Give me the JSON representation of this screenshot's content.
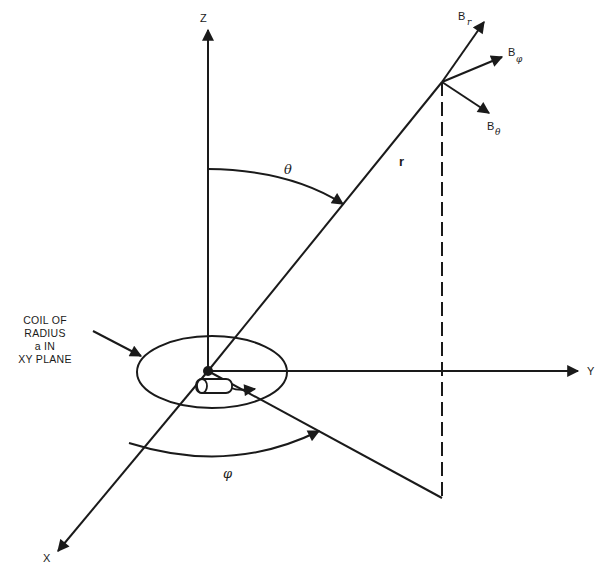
{
  "diagram": {
    "type": "spherical-coordinate field diagram",
    "axes": {
      "z": "Z",
      "y": "Y",
      "x": "X"
    },
    "vector_labels": {
      "radius": "r",
      "polar_angle": "θ",
      "azimuth_angle": "φ"
    },
    "field_components": [
      {
        "base": "B",
        "sub": "r"
      },
      {
        "base": "B",
        "sub": "φ"
      },
      {
        "base": "B",
        "sub": "θ"
      }
    ],
    "coil_annotation": [
      "COIL OF",
      "RADIUS",
      "a IN",
      "XY PLANE"
    ],
    "colors": {
      "ink": "#1a1a1a",
      "background": "#ffffff"
    }
  }
}
